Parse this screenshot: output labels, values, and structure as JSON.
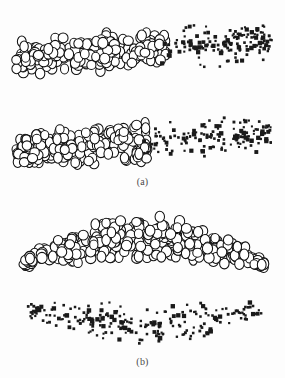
{
  "figure": {
    "background_color": "#fdfdfd",
    "width": 285,
    "height": 378,
    "ring_marker_color": "#111111",
    "ring_fill_color": "#ffffff",
    "dot_marker_color": "#1a1a1a",
    "caption_color": "#4a4a4a"
  },
  "panels": [
    {
      "id": "panel-a",
      "caption": "(a)",
      "caption_y": 176,
      "clusters": [
        {
          "id": "a-top-rings",
          "marker": "open-circle",
          "count": 250,
          "shape": "slanted-band",
          "x_range": [
            14,
            168
          ],
          "y_range": [
            12,
            84
          ],
          "marker_size": 9
        },
        {
          "id": "a-top-dots",
          "marker": "filled-square",
          "count": 150,
          "shape": "fan-right",
          "x_range": [
            158,
            272
          ],
          "y_range": [
            18,
            76
          ],
          "marker_size": 3
        },
        {
          "id": "a-bottom-rings",
          "marker": "open-circle",
          "count": 235,
          "shape": "slanted-band",
          "x_range": [
            14,
            150
          ],
          "y_range": [
            106,
            176
          ],
          "marker_size": 9
        },
        {
          "id": "a-bottom-dots",
          "marker": "filled-square",
          "count": 150,
          "shape": "fan-right",
          "x_range": [
            140,
            272
          ],
          "y_range": [
            112,
            172
          ],
          "marker_size": 3
        }
      ]
    },
    {
      "id": "panel-b",
      "caption": "(b)",
      "caption_y": 356,
      "clusters": [
        {
          "id": "b-rings",
          "marker": "open-circle",
          "count": 340,
          "shape": "lens-arc",
          "x_range": [
            22,
            266
          ],
          "y_range": [
            204,
            272
          ],
          "marker_size": 9
        },
        {
          "id": "b-dots",
          "marker": "filled-square",
          "count": 230,
          "shape": "inverted-arc",
          "x_range": [
            28,
            263
          ],
          "y_range": [
            298,
            348
          ],
          "marker_size": 3
        }
      ]
    }
  ],
  "chart_data": {
    "type": "scatter",
    "title": "",
    "xlabel": "",
    "ylabel": "",
    "grid": false,
    "legend": "none",
    "series": [
      {
        "name": "a-top-rings",
        "marker": "open-circle",
        "panel": "(a)",
        "n_points": 250,
        "x_extent": [
          14,
          168
        ],
        "y_extent": [
          12,
          84
        ]
      },
      {
        "name": "a-top-dots",
        "marker": "filled-square",
        "panel": "(a)",
        "n_points": 150,
        "x_extent": [
          158,
          272
        ],
        "y_extent": [
          18,
          76
        ]
      },
      {
        "name": "a-bottom-rings",
        "marker": "open-circle",
        "panel": "(a)",
        "n_points": 235,
        "x_extent": [
          14,
          150
        ],
        "y_extent": [
          106,
          176
        ]
      },
      {
        "name": "a-bottom-dots",
        "marker": "filled-square",
        "panel": "(a)",
        "n_points": 150,
        "x_extent": [
          140,
          272
        ],
        "y_extent": [
          112,
          172
        ]
      },
      {
        "name": "b-rings",
        "marker": "open-circle",
        "panel": "(b)",
        "n_points": 340,
        "x_extent": [
          22,
          266
        ],
        "y_extent": [
          204,
          272
        ]
      },
      {
        "name": "b-dots",
        "marker": "filled-square",
        "panel": "(b)",
        "n_points": 230,
        "x_extent": [
          28,
          263
        ],
        "y_extent": [
          298,
          348
        ]
      }
    ]
  }
}
